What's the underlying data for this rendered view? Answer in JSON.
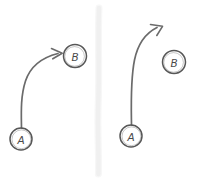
{
  "diagram": {
    "background_color": "#ffffff",
    "stroke_color": "#6b6b6b",
    "node_stroke_color": "#575757",
    "divider_color": "#f0f0f0",
    "style": "hand-drawn sketch",
    "panels": [
      {
        "id": "left-panel",
        "name": "connected-arrow-example",
        "nodes": [
          {
            "id": "a-left",
            "label": "A",
            "cx": 21,
            "cy": 139,
            "r": 11
          },
          {
            "id": "b-left",
            "label": "B",
            "cx": 75,
            "cy": 56,
            "r": 11.5
          }
        ],
        "arrow": {
          "id": "arrow-left",
          "from": "A",
          "to": "B",
          "connects": true,
          "head_angle_deg": 10
        }
      },
      {
        "id": "right-panel",
        "name": "unconnected-arrow-example",
        "nodes": [
          {
            "id": "a-right",
            "label": "A",
            "cx": 131,
            "cy": 136,
            "r": 11
          },
          {
            "id": "b-right",
            "label": "B",
            "cx": 174,
            "cy": 62,
            "r": 11.5
          }
        ],
        "arrow": {
          "id": "arrow-right",
          "from": "A",
          "to": null,
          "connects": false,
          "head_angle_deg": 30
        }
      }
    ],
    "divider": {
      "id": "panel-divider",
      "x": 98,
      "y_top": 6,
      "y_bottom": 176
    }
  }
}
